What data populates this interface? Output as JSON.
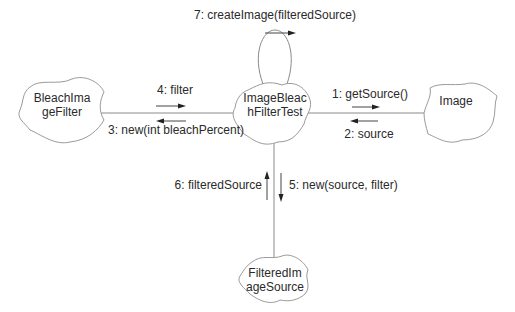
{
  "diagram": {
    "type": "UML collaboration diagram",
    "objects": [
      {
        "id": "bleach",
        "line1": "BleachIma",
        "line2": "geFilter"
      },
      {
        "id": "test",
        "line1": "ImageBleac",
        "line2": "hFilterTest"
      },
      {
        "id": "image",
        "line1": "Image",
        "line2": ""
      },
      {
        "id": "filtered",
        "line1": "FilteredIm",
        "line2": "ageSource"
      }
    ],
    "messages": [
      {
        "seq": "1",
        "label": "1: getSource()",
        "from": "test",
        "to": "image"
      },
      {
        "seq": "2",
        "label": "2: source",
        "from": "image",
        "to": "test"
      },
      {
        "seq": "3",
        "label": "3: new(int bleachPercent)",
        "from": "test",
        "to": "bleach"
      },
      {
        "seq": "4",
        "label": "4: filter",
        "from": "bleach",
        "to": "test"
      },
      {
        "seq": "5",
        "label": "5: new(source, filter)",
        "from": "test",
        "to": "filtered"
      },
      {
        "seq": "6",
        "label": "6: filteredSource",
        "from": "filtered",
        "to": "test"
      },
      {
        "seq": "7",
        "label": "7: createImage(filteredSource)",
        "from": "test",
        "to": "test"
      }
    ]
  }
}
